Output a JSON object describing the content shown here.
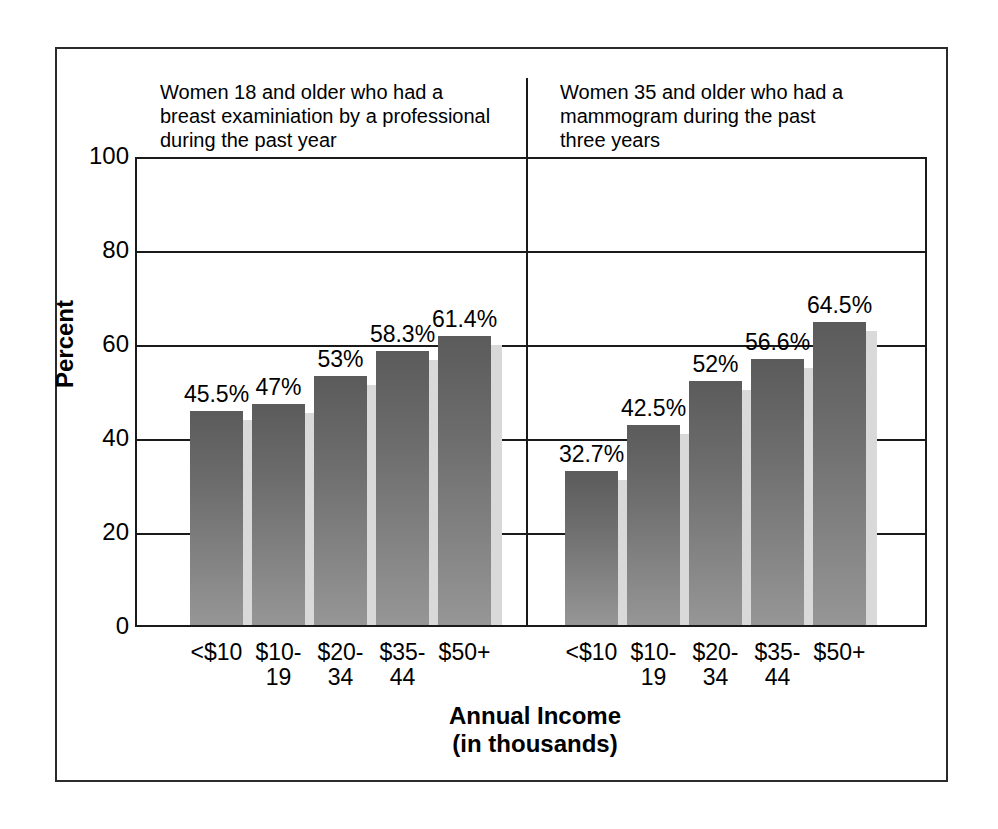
{
  "figure": {
    "background_color": "#ffffff",
    "border_color": "#2b2b2b",
    "bar_color_top": "#5b5b5b",
    "bar_color_bottom": "#969696",
    "bar_shadow_color": "#d9d9d9"
  },
  "chart_data": {
    "type": "bar",
    "title": "",
    "xlabel": "Annual Income\n(in thousands)",
    "ylabel": "Percent",
    "ylim": [
      0,
      100
    ],
    "yticks": [
      0,
      20,
      40,
      60,
      80,
      100
    ],
    "ytick_labels": [
      "0",
      "20",
      "40",
      "60",
      "80",
      "100"
    ],
    "grid": true,
    "legend": "none",
    "categories": [
      "<$10",
      "$10-\n19",
      "$20-\n34",
      "$35-\n44",
      "$50+"
    ],
    "panels": [
      {
        "name": "breast-exam-panel",
        "title": "Women 18 and older who had a\nbreast examiniation by a professional\nduring the past year",
        "values": [
          45.5,
          47,
          53,
          58.3,
          61.4
        ],
        "value_labels": [
          "45.5%",
          "47%",
          "53%",
          "58.3%",
          "61.4%"
        ]
      },
      {
        "name": "mammogram-panel",
        "title": "Women 35 and older who had a\nmammogram during the past\nthree years",
        "values": [
          32.7,
          42.5,
          52,
          56.6,
          64.5
        ],
        "value_labels": [
          "32.7%",
          "42.5%",
          "52%",
          "56.6%",
          "64.5%"
        ]
      }
    ]
  }
}
